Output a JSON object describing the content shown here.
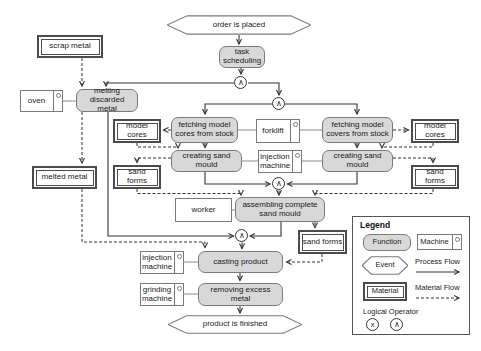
{
  "diagram": {
    "nodes": {
      "order_placed": "order is placed",
      "task_scheduling": "task scheduling",
      "scrap_metal": "scrap metal",
      "oven": "oven",
      "melting": "melting discarded metal",
      "melted_metal": "melted metal",
      "model_cores_left": "model cores",
      "fetching_cores": "fetching model cores from stock",
      "forklift": "forklift",
      "fetching_covers": "fetching model covers from stock",
      "model_cores_right": "model cores",
      "creating_left": "creating sand mould",
      "injection_machine_mid": "injection machine",
      "creating_right": "creating sand mould",
      "sand_forms_left": "sand forms",
      "sand_forms_right": "sand forms",
      "worker": "worker",
      "assembling": "assembling complete sand mould",
      "sand_forms_mid": "sand forms",
      "injection_machine_bottom": "injection machine",
      "casting": "casting product",
      "grinding": "grinding machine",
      "removing": "removing excess metal",
      "product_finished": "product is finished"
    },
    "operators": {
      "and": "∧",
      "xor": "x"
    },
    "legend": {
      "title": "Legend",
      "function": "Function",
      "machine": "Machine",
      "event": "Event",
      "process_flow": "Process Flow",
      "material": "Material",
      "material_flow": "Material Flow",
      "logical_operator": "Logical Operator"
    },
    "colors": {
      "function_fill": "#d8d8d8",
      "shape_border": "#7a7a7a",
      "material_border": "#4b4b4b",
      "flow_line": "#333333"
    }
  }
}
